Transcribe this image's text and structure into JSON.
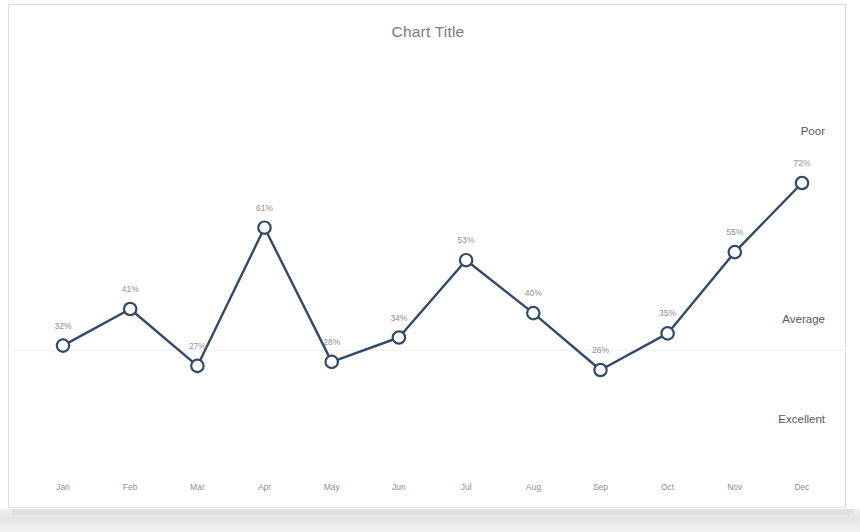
{
  "frame": {
    "border_color": "#dcdcdc",
    "background": "#ffffff"
  },
  "chart": {
    "title": "Chart Title",
    "title_color": "#7b7b7b",
    "line_color": "#2f4a6b",
    "marker_fill": "#ffffff",
    "label_color": "#8d8f96",
    "band_label_color": "#51556b"
  },
  "band_labels": [
    {
      "text": "Poor",
      "y": 120
    },
    {
      "text": "Average",
      "y": 308
    },
    {
      "text": "Excellent",
      "y": 408
    }
  ],
  "chart_data": {
    "type": "line",
    "title": "Chart Title",
    "xlabel": "",
    "ylabel": "",
    "categories": [
      "Jan",
      "Feb",
      "Mar",
      "Apr",
      "May",
      "Jun",
      "Jul",
      "Aug",
      "Sep",
      "Oct",
      "Nov",
      "Dec"
    ],
    "values": [
      32,
      41,
      27,
      61,
      28,
      34,
      53,
      40,
      26,
      35,
      55,
      72
    ],
    "value_labels": [
      "32%",
      "41%",
      "27%",
      "61%",
      "28%",
      "34%",
      "53%",
      "40%",
      "26%",
      "35%",
      "55%",
      "72%"
    ],
    "series": [
      {
        "name": "",
        "values": [
          32,
          41,
          27,
          61,
          28,
          34,
          53,
          40,
          26,
          35,
          55,
          72
        ]
      }
    ],
    "ylim": [
      0,
      100
    ],
    "grid": false,
    "legend": "none",
    "annotations": [
      "Poor",
      "Average",
      "Excellent"
    ],
    "marker": "open-circle",
    "units": "percent"
  }
}
